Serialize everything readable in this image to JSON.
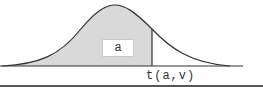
{
  "diagram": {
    "type": "t-distribution-critical-value",
    "area_label": "a",
    "critical_value_label": "t(a,v)",
    "colors": {
      "shaded_area": "#d9d9d9",
      "curve": "#333333",
      "axis": "#333333",
      "background": "#ffffff"
    }
  }
}
